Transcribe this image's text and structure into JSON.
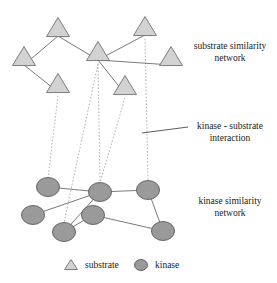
{
  "figure": {
    "title": "",
    "background_color": "#ffffff",
    "width": 277,
    "height": 283
  },
  "style": {
    "triangle_fill": "#d2d2d2",
    "triangle_stroke": "#707070",
    "circle_fill": "#9a9a9a",
    "circle_stroke": "#5a5a5a",
    "solid_edge_color": "#6b6b6b",
    "dashed_edge_color": "#a8a8a8",
    "leader_line_color": "#4a4a4a",
    "text_color": "#1a1a1a"
  },
  "annotations": {
    "substrate_network": {
      "line1": "substrate similarity",
      "line2": "network"
    },
    "interaction": {
      "line1": "kinase - substrate",
      "line2": "interaction"
    },
    "kinase_network": {
      "line1": "kinase similarity",
      "line2": "network"
    }
  },
  "legend": {
    "substrate_label": "substrate",
    "kinase_label": "kinase",
    "substrate_marker": "triangle-icon",
    "kinase_marker": "circle-icon"
  },
  "chart_data": {
    "type": "diagram",
    "layers": [
      {
        "name": "substrate similarity network",
        "node_shape": "triangle",
        "nodes": [
          {
            "id": "s1",
            "x": 58,
            "y": 28
          },
          {
            "id": "s2",
            "x": 24,
            "y": 57
          },
          {
            "id": "s3",
            "x": 58,
            "y": 84
          },
          {
            "id": "s4",
            "x": 98,
            "y": 52
          },
          {
            "id": "s5",
            "x": 145,
            "y": 27
          },
          {
            "id": "s6",
            "x": 171,
            "y": 57
          },
          {
            "id": "s7",
            "x": 125,
            "y": 86
          }
        ],
        "edges": [
          {
            "source": "s1",
            "target": "s2"
          },
          {
            "source": "s1",
            "target": "s4"
          },
          {
            "source": "s2",
            "target": "s3"
          },
          {
            "source": "s4",
            "target": "s5"
          },
          {
            "source": "s4",
            "target": "s6"
          },
          {
            "source": "s4",
            "target": "s7"
          }
        ]
      },
      {
        "name": "kinase similarity network",
        "node_shape": "circle",
        "nodes": [
          {
            "id": "k1",
            "x": 48,
            "y": 187
          },
          {
            "id": "k2",
            "x": 100,
            "y": 192
          },
          {
            "id": "k3",
            "x": 148,
            "y": 190
          },
          {
            "id": "k4",
            "x": 33,
            "y": 215
          },
          {
            "id": "k5",
            "x": 93,
            "y": 215
          },
          {
            "id": "k6",
            "x": 64,
            "y": 232
          },
          {
            "id": "k7",
            "x": 163,
            "y": 231
          }
        ],
        "edges": [
          {
            "source": "k1",
            "target": "k2"
          },
          {
            "source": "k2",
            "target": "k3"
          },
          {
            "source": "k2",
            "target": "k4"
          },
          {
            "source": "k2",
            "target": "k6"
          },
          {
            "source": "k3",
            "target": "k7"
          },
          {
            "source": "k5",
            "target": "k6"
          },
          {
            "source": "k5",
            "target": "k7"
          }
        ]
      }
    ],
    "interlayer_edges": [
      {
        "source": "s3",
        "target": "k1",
        "style": "dashed"
      },
      {
        "source": "s4",
        "target": "k2",
        "style": "dashed"
      },
      {
        "source": "s4",
        "target": "k6",
        "style": "dashed"
      },
      {
        "source": "s7",
        "target": "k2",
        "style": "dashed"
      },
      {
        "source": "s5",
        "target": "k3",
        "style": "dashed"
      }
    ],
    "leader_line": {
      "x1": 142,
      "y1": 133,
      "x2": 188,
      "y2": 127
    }
  }
}
